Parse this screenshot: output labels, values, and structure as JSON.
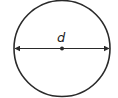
{
  "diagram": {
    "shape": "circle",
    "diameter_label": "d",
    "colors": {
      "stroke": "#2a2a2a",
      "background": "#ffffff"
    },
    "elements": [
      {
        "type": "circle",
        "cx": 62,
        "cy": 48,
        "r": 48
      },
      {
        "type": "double-arrow-line",
        "from": [
          14,
          48
        ],
        "to": [
          110,
          48
        ],
        "label": "d"
      },
      {
        "type": "center-point",
        "x": 62,
        "y": 48
      }
    ]
  }
}
